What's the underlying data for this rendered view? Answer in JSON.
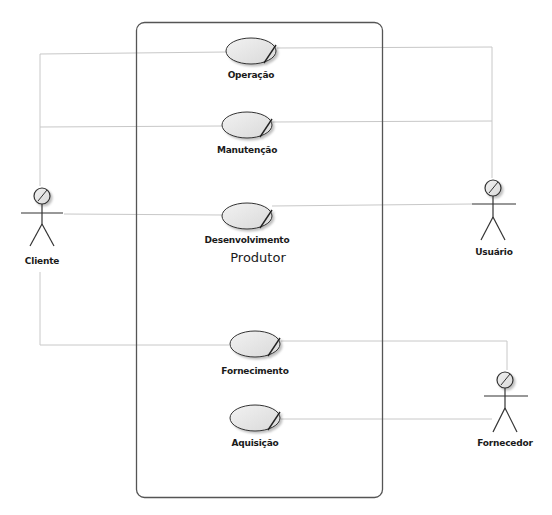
{
  "diagram": {
    "type": "uml-use-case",
    "colors": {
      "boundary": "#555555",
      "association_line": "#c8c8c8",
      "usecase_fill": "#e6e6e6",
      "usecase_stroke": "#333333",
      "actor_stroke": "#333333",
      "label_text": "#1a1a1a"
    },
    "system": {
      "name": "Produtor"
    },
    "use_cases": [
      {
        "id": "operacao",
        "label": "Operação"
      },
      {
        "id": "manutencao",
        "label": "Manutenção"
      },
      {
        "id": "desenvolvimento",
        "label": "Desenvolvimento"
      },
      {
        "id": "fornecimento",
        "label": "Fornecimento"
      },
      {
        "id": "aquisicao",
        "label": "Aquisição"
      }
    ],
    "actors": [
      {
        "id": "cliente",
        "label": "Cliente",
        "icon": "stick-figure-icon"
      },
      {
        "id": "usuario",
        "label": "Usuário",
        "icon": "stick-figure-icon"
      },
      {
        "id": "fornecedor",
        "label": "Fornecedor",
        "icon": "stick-figure-icon"
      }
    ],
    "associations": [
      {
        "actor": "Cliente",
        "use_case": "Operação"
      },
      {
        "actor": "Cliente",
        "use_case": "Manutenção"
      },
      {
        "actor": "Cliente",
        "use_case": "Desenvolvimento"
      },
      {
        "actor": "Cliente",
        "use_case": "Fornecimento"
      },
      {
        "actor": "Usuário",
        "use_case": "Operação"
      },
      {
        "actor": "Usuário",
        "use_case": "Manutenção"
      },
      {
        "actor": "Usuário",
        "use_case": "Desenvolvimento"
      },
      {
        "actor": "Fornecedor",
        "use_case": "Fornecimento"
      },
      {
        "actor": "Fornecedor",
        "use_case": "Aquisição"
      }
    ]
  }
}
